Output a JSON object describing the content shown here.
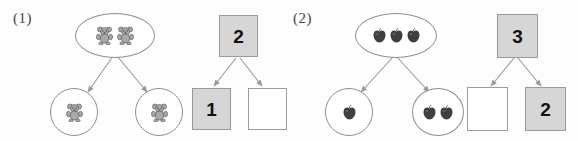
{
  "page": {
    "type": "math-worksheet",
    "topic": "number-bond decomposition",
    "background_color": "#fdfdfd",
    "line_color": "#8f8f8f",
    "filled_box_color": "#d6d6d6",
    "empty_box_color": "#ffffff",
    "text_color": "#3a3a3a"
  },
  "problems": [
    {
      "label": "(1)",
      "object_icon": "teddy-bear-icon",
      "object_name": "teddy bear",
      "picture": {
        "whole": {
          "count": 2,
          "shape": "oval"
        },
        "parts": [
          {
            "count": 1,
            "shape": "circle",
            "position": "left"
          },
          {
            "count": 1,
            "shape": "circle",
            "position": "right"
          }
        ]
      },
      "number_bond": {
        "whole": {
          "value": "2",
          "filled": true
        },
        "parts": [
          {
            "value": "1",
            "filled": true,
            "position": "left"
          },
          {
            "value": "",
            "filled": false,
            "position": "right"
          }
        ]
      }
    },
    {
      "label": "(2)",
      "object_icon": "apple-icon",
      "object_name": "apple",
      "picture": {
        "whole": {
          "count": 3,
          "shape": "oval"
        },
        "parts": [
          {
            "count": 1,
            "shape": "circle",
            "position": "left"
          },
          {
            "count": 2,
            "shape": "circle",
            "position": "right"
          }
        ]
      },
      "number_bond": {
        "whole": {
          "value": "3",
          "filled": true
        },
        "parts": [
          {
            "value": "",
            "filled": false,
            "position": "left"
          },
          {
            "value": "2",
            "filled": true,
            "position": "right"
          }
        ]
      }
    }
  ]
}
